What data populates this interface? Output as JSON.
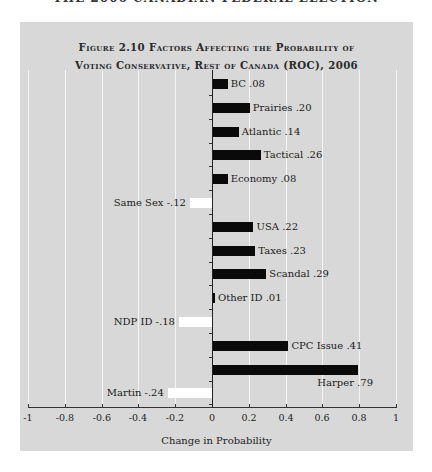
{
  "running_head": "THE 2006 CANADIAN FEDERAL ELECTION",
  "chart_data": {
    "type": "bar",
    "orientation": "horizontal",
    "title": "FIGURE 2.10 FACTORS AFFECTING THE PROBABILITY OF VOTING CONSERVATIVE, REST OF CANADA (ROC), 2006",
    "title_lines": [
      "Figure 2.10 Factors Affecting the Probability of",
      "Voting Conservative, Rest of Canada (ROC), 2006"
    ],
    "xlabel": "Change in Probability",
    "ylabel": "",
    "xlim": [
      -1,
      1
    ],
    "xticks": [
      "-1",
      "-0.8",
      "-0.6",
      "-0.4",
      "-0.2",
      "0",
      "0.2",
      "0.4",
      "0.6",
      "0.8",
      "1"
    ],
    "grid": true,
    "categories": [
      "BC",
      "Prairies",
      "Atlantic",
      "Tactical",
      "Economy",
      "Same Sex",
      "USA",
      "Taxes",
      "Scandal",
      "Other ID",
      "NDP ID",
      "CPC Issue",
      "Harper",
      "Martin"
    ],
    "values": [
      0.08,
      0.2,
      0.14,
      0.26,
      0.08,
      -0.12,
      0.22,
      0.23,
      0.29,
      0.01,
      -0.18,
      0.41,
      0.79,
      -0.24
    ],
    "labels": [
      "BC .08",
      "Prairies .20",
      "Atlantic .14",
      "Tactical .26",
      "Economy .08",
      "Same Sex -.12",
      "USA .22",
      "Taxes .23",
      "Scandal .29",
      "Other ID .01",
      "NDP ID -.18",
      "CPC Issue .41",
      "Harper .79",
      "Martin -.24"
    ],
    "colors": {
      "positive": "#0a0a0a",
      "negative": "#ffffff",
      "background": "#d8d8d8",
      "grid": "#f4f4f4"
    }
  }
}
